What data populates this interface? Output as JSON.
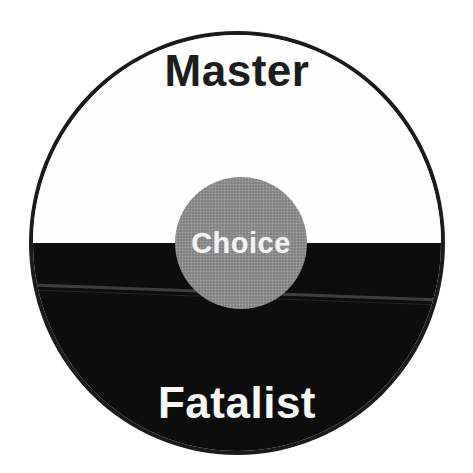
{
  "diagram": {
    "top_label": "Master",
    "center_label": "Choice",
    "bottom_label": "Fatalist",
    "colors": {
      "page_bg": "#ffffff",
      "outline": "#1b1b1b",
      "top_half": "#fefefe",
      "bottom_half": "#0d0d0d",
      "center_circle": "#8d8d8d",
      "top_text": "#1d1d1d",
      "bottom_text": "#f7f7f7",
      "center_text": "#f2f2f2",
      "scan_artifact": "#6f6f6f"
    }
  }
}
